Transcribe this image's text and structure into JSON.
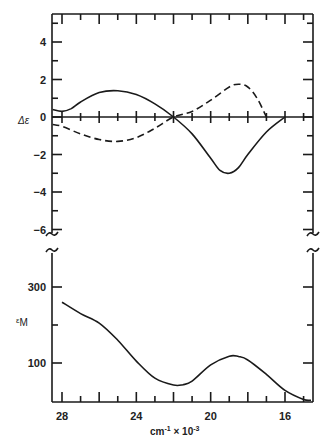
{
  "chart_data": {
    "type": "line",
    "title": "",
    "xlabel": "cm⁻¹ × 10⁻³",
    "x_ticks": [
      28,
      24,
      20,
      16
    ],
    "xlim": [
      28.5,
      14.4
    ],
    "panels": [
      {
        "name": "CD",
        "ylabel": "Δε",
        "yticks": [
          4,
          2,
          0,
          -2,
          -4,
          -6
        ],
        "ylim": [
          -6.5,
          5.5
        ],
        "series": [
          {
            "name": "solid",
            "style": "solid",
            "x": [
              28.5,
              28.0,
              27.5,
              27.0,
              26.0,
              25.0,
              24.0,
              23.0,
              22.0,
              21.0,
              20.0,
              19.5,
              19.0,
              18.5,
              18.0,
              17.0,
              16.0
            ],
            "y": [
              0.4,
              0.3,
              0.45,
              0.8,
              1.3,
              1.4,
              1.2,
              0.7,
              0.0,
              -0.9,
              -2.2,
              -2.85,
              -3.0,
              -2.7,
              -2.0,
              -0.8,
              0.0
            ]
          },
          {
            "name": "dashed",
            "style": "dashed",
            "x": [
              28.5,
              28.0,
              27.0,
              26.0,
              25.0,
              24.0,
              23.0,
              22.0,
              21.0,
              20.0,
              19.0,
              18.5,
              18.0,
              17.5,
              17.0
            ],
            "y": [
              -0.4,
              -0.5,
              -0.9,
              -1.2,
              -1.3,
              -1.1,
              -0.6,
              0.0,
              0.3,
              0.9,
              1.6,
              1.75,
              1.6,
              1.0,
              0.0
            ]
          }
        ]
      },
      {
        "name": "Absorption",
        "ylabel": "εM",
        "yticks": [
          300,
          100
        ],
        "ylim": [
          0,
          380
        ],
        "series": [
          {
            "name": "solid",
            "style": "solid",
            "x": [
              28.0,
              27.0,
              26.0,
              25.0,
              24.0,
              23.0,
              22.0,
              21.5,
              21.0,
              20.0,
              19.0,
              18.5,
              18.0,
              17.0,
              16.0,
              15.0,
              14.6
            ],
            "y": [
              260,
              230,
              205,
              160,
              105,
              60,
              42,
              43,
              52,
              95,
              118,
              117,
              108,
              70,
              28,
              4,
              2
            ]
          }
        ]
      }
    ]
  },
  "labels": {
    "delta_eps": "Δε",
    "eps_m_prefix": "ε",
    "eps_m_sub": "M",
    "x_axis_main": "cm",
    "x_axis_exp1": "-1",
    "x_axis_times": " × 10",
    "x_axis_exp2": "-3"
  }
}
